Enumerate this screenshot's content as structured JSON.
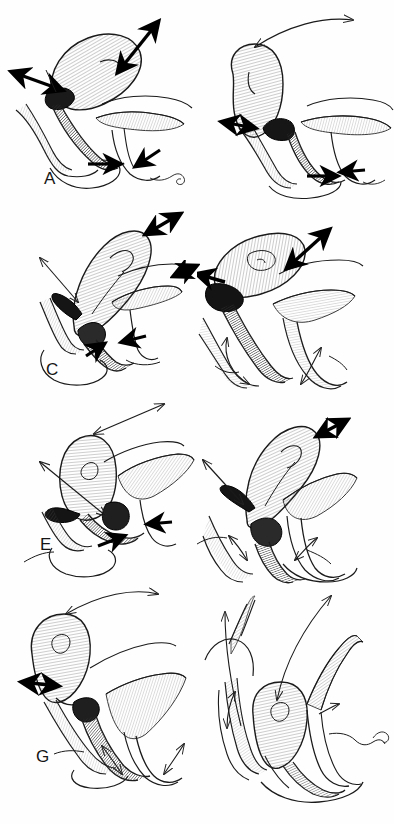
{
  "figure": {
    "background_color": "#fefefe",
    "ink_color": "#1a1a1a",
    "panel_count": 8,
    "columns": 2,
    "rows": 4,
    "width_px": 394,
    "height_px": 824
  },
  "panels": [
    {
      "id": "A",
      "label": "A",
      "label_x": 44,
      "label_y": 178,
      "origin_x": 0,
      "origin_y": 0,
      "width": 197,
      "height": 206,
      "description": "Uterus tilted anteverted to the right; bladder below; thick double-headed arrows at fundus and at cervix",
      "arrows": [
        {
          "name": "fundus-traction-arrow",
          "style": "thick-double",
          "from_x": 118,
          "from_y": 72,
          "to_x": 158,
          "to_y": 22
        },
        {
          "name": "cervix-lateral-arrow",
          "style": "thick-double",
          "from_x": 62,
          "from_y": 90,
          "to_x": 12,
          "to_y": 72
        },
        {
          "name": "vaginal-apex-arrow",
          "style": "thick-single",
          "from_x": 88,
          "from_y": 164,
          "to_x": 118,
          "to_y": 164
        },
        {
          "name": "posterior-wall-arrow",
          "style": "thick-single",
          "from_x": 158,
          "from_y": 152,
          "to_x": 138,
          "to_y": 166
        }
      ]
    },
    {
      "id": "B",
      "label": "B",
      "label_x": 243,
      "label_y": 184,
      "origin_x": 197,
      "origin_y": 0,
      "width": 197,
      "height": 206,
      "description": "Uterus retroverted, long thin curved arrow from fundus sweeping up and right",
      "arrows": [
        {
          "name": "fundus-sweep-arrow",
          "style": "thin-double-curved",
          "from_x": 58,
          "from_y": 47,
          "to_x": 158,
          "to_y": 20
        },
        {
          "name": "cervix-lateral-arrow",
          "style": "thick-double",
          "from_x": 25,
          "from_y": 122,
          "to_x": 58,
          "to_y": 128
        },
        {
          "name": "vaginal-apex-arrow",
          "style": "thick-single",
          "from_x": 110,
          "from_y": 176,
          "to_x": 140,
          "to_y": 176
        },
        {
          "name": "posterior-wall-arrow",
          "style": "thick-single",
          "from_x": 165,
          "from_y": 170,
          "to_x": 145,
          "to_y": 172
        }
      ]
    },
    {
      "id": "C",
      "label": "C",
      "label_x": 46,
      "label_y": 366,
      "origin_x": 0,
      "origin_y": 206,
      "width": 197,
      "height": 190,
      "description": "Uterus elongated upward-right; thin arrow to left of cervix; thick arrows at fundus tip and at vaginal apex",
      "arrows": [
        {
          "name": "fundus-traction-arrow",
          "style": "thick-double",
          "from_x": 146,
          "from_y": 28,
          "to_x": 178,
          "to_y": 10
        },
        {
          "name": "cervix-elevation-arrow",
          "style": "thin-double",
          "from_x": 72,
          "from_y": 92,
          "to_x": 40,
          "to_y": 52
        },
        {
          "name": "vaginal-apex-arrow",
          "style": "thick-single",
          "from_x": 92,
          "from_y": 146,
          "to_x": 102,
          "to_y": 138
        },
        {
          "name": "rectal-arrow",
          "style": "thick-single",
          "from_x": 142,
          "from_y": 132,
          "to_x": 124,
          "to_y": 136
        }
      ]
    },
    {
      "id": "D",
      "label": "D",
      "label_x": 216,
      "label_y": 368,
      "origin_x": 197,
      "origin_y": 206,
      "width": 197,
      "height": 190,
      "description": "Uterus retroverted horizontal; thick double arrow at fundus; thin curved arrows in bladder and rectum",
      "arrows": [
        {
          "name": "fundus-traction-arrow",
          "style": "thick-double",
          "from_x": 90,
          "from_y": 62,
          "to_x": 130,
          "to_y": 26
        },
        {
          "name": "cervix-lateral-arrow",
          "style": "thick-double",
          "from_x": 6,
          "from_y": 68,
          "to_x": 28,
          "to_y": 76
        },
        {
          "name": "bladder-loop-arrow",
          "style": "thin-double",
          "from_x": 30,
          "from_y": 132,
          "to_x": 56,
          "to_y": 176
        },
        {
          "name": "rectum-loop-arrow",
          "style": "thin-double",
          "from_x": 104,
          "from_y": 174,
          "to_x": 124,
          "to_y": 142
        }
      ]
    },
    {
      "id": "E",
      "label": "E",
      "label_x": 42,
      "label_y": 543,
      "origin_x": 0,
      "origin_y": 396,
      "width": 197,
      "height": 190,
      "description": "Uterus rounded, anteflexed; long thin diagonal arrow to the upper right, second thin arrow to upper left",
      "arrows": [
        {
          "name": "fundus-sweep-arrow",
          "style": "thin-double",
          "from_x": 94,
          "from_y": 38,
          "to_x": 162,
          "to_y": 10
        },
        {
          "name": "cervix-elevation-arrow",
          "style": "thin-double",
          "from_x": 105,
          "from_y": 120,
          "to_x": 42,
          "to_y": 68
        },
        {
          "name": "vaginal-apex-arrow",
          "style": "thick-single",
          "from_x": 100,
          "from_y": 146,
          "to_x": 122,
          "to_y": 140
        },
        {
          "name": "rectal-arrow",
          "style": "thick-single",
          "from_x": 168,
          "from_y": 126,
          "to_x": 148,
          "to_y": 128
        }
      ]
    },
    {
      "id": "F",
      "label": "F",
      "label_x": 212,
      "label_y": 568,
      "origin_x": 197,
      "origin_y": 396,
      "width": 197,
      "height": 190,
      "description": "Uterus curved upward right, thick arrow at fundus tip; thin arrow to upper left; thin loop arrows in bladder and rectum",
      "arrows": [
        {
          "name": "fundus-traction-arrow",
          "style": "thick-double",
          "from_x": 118,
          "from_y": 38,
          "to_x": 148,
          "to_y": 24
        },
        {
          "name": "cervix-elevation-arrow",
          "style": "thin-double",
          "from_x": 46,
          "from_y": 106,
          "to_x": 8,
          "to_y": 64
        },
        {
          "name": "bladder-loop-arrow",
          "style": "thin-double",
          "from_x": 50,
          "from_y": 162,
          "to_x": 32,
          "to_y": 140
        },
        {
          "name": "rectum-loop-arrow",
          "style": "thin-double",
          "from_x": 98,
          "from_y": 162,
          "to_x": 118,
          "to_y": 142
        }
      ]
    },
    {
      "id": "G",
      "label": "G",
      "label_x": 36,
      "label_y": 760,
      "origin_x": 0,
      "origin_y": 586,
      "width": 197,
      "height": 205,
      "description": "Uterus hanging down-left, descended; long thin arrow sweeping to upper right; thick arrow at cervix pointing left",
      "arrows": [
        {
          "name": "fundus-sweep-arrow",
          "style": "thin-double-curved",
          "from_x": 66,
          "from_y": 28,
          "to_x": 156,
          "to_y": 10
        },
        {
          "name": "cervix-traction-arrow",
          "style": "thick-double",
          "from_x": 58,
          "from_y": 100,
          "to_x": 24,
          "to_y": 96
        },
        {
          "name": "bladder-loop-arrow",
          "style": "thin-double",
          "from_x": 122,
          "from_y": 186,
          "to_x": 104,
          "to_y": 162
        },
        {
          "name": "rectum-loop-arrow",
          "style": "thin-double",
          "from_x": 166,
          "from_y": 186,
          "to_x": 182,
          "to_y": 160
        }
      ]
    },
    {
      "id": "H",
      "label": "H",
      "label_x": 218,
      "label_y": 782,
      "origin_x": 197,
      "origin_y": 586,
      "width": 197,
      "height": 205,
      "description": "Complete prolapse; uterus descended between canals; two long thin arrows sweeping upward out of the pelvis",
      "arrows": [
        {
          "name": "anterior-sweep-arrow",
          "style": "thin-single-curved",
          "from_x": 42,
          "from_y": 138,
          "to_x": 28,
          "to_y": 26
        },
        {
          "name": "descent-sweep-arrow",
          "style": "thin-double-curved",
          "from_x": 80,
          "from_y": 112,
          "to_x": 134,
          "to_y": 10
        },
        {
          "name": "bladder-elevation-arrow",
          "style": "thin-double",
          "from_x": 30,
          "from_y": 140,
          "to_x": 38,
          "to_y": 106
        },
        {
          "name": "rectal-arrow",
          "style": "thin-single",
          "from_x": 122,
          "from_y": 128,
          "to_x": 140,
          "to_y": 118
        }
      ]
    }
  ],
  "structures": {
    "uterus": "uterine-corpus",
    "cervix": "cervix",
    "bladder": "bladder",
    "vagina": "vaginal-canal",
    "rectum": "rectum"
  }
}
